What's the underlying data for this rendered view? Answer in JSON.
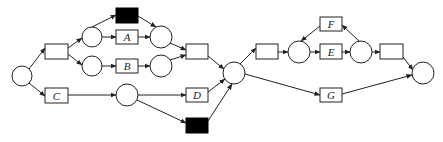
{
  "diagram": {
    "type": "petri-net",
    "places": [
      {
        "id": "p_start",
        "cx": 22,
        "cy": 76,
        "r": 10
      },
      {
        "id": "p1",
        "cx": 92,
        "cy": 37,
        "r": 10
      },
      {
        "id": "p2",
        "cx": 92,
        "cy": 66,
        "r": 10
      },
      {
        "id": "p3",
        "cx": 161,
        "cy": 37,
        "r": 11
      },
      {
        "id": "p4",
        "cx": 161,
        "cy": 66,
        "r": 11
      },
      {
        "id": "p5",
        "cx": 127,
        "cy": 95,
        "r": 11
      },
      {
        "id": "p_join",
        "cx": 234,
        "cy": 73,
        "r": 11
      },
      {
        "id": "p6",
        "cx": 299,
        "cy": 52,
        "r": 11
      },
      {
        "id": "p7",
        "cx": 361,
        "cy": 52,
        "r": 11
      },
      {
        "id": "p_end",
        "cx": 423,
        "cy": 73,
        "r": 11
      }
    ],
    "transitions": [
      {
        "id": "t_split",
        "label": "",
        "x": 45,
        "y": 44,
        "w": 23,
        "h": 15,
        "black": false
      },
      {
        "id": "t_C",
        "label": "C",
        "x": 45,
        "y": 88,
        "w": 23,
        "h": 15,
        "black": false
      },
      {
        "id": "t_skip1",
        "label": "",
        "x": 116,
        "y": 8,
        "w": 22,
        "h": 15,
        "black": true
      },
      {
        "id": "t_A",
        "label": "A",
        "x": 116,
        "y": 30,
        "w": 22,
        "h": 14,
        "black": false
      },
      {
        "id": "t_B",
        "label": "B",
        "x": 116,
        "y": 59,
        "w": 22,
        "h": 14,
        "black": false
      },
      {
        "id": "t_join1",
        "label": "",
        "x": 186,
        "y": 44,
        "w": 22,
        "h": 15,
        "black": false
      },
      {
        "id": "t_D",
        "label": "D",
        "x": 186,
        "y": 88,
        "w": 22,
        "h": 14,
        "black": false
      },
      {
        "id": "t_skip2",
        "label": "",
        "x": 186,
        "y": 118,
        "w": 22,
        "h": 15,
        "black": true
      },
      {
        "id": "t_split2",
        "label": "",
        "x": 256,
        "y": 44,
        "w": 22,
        "h": 15,
        "black": false
      },
      {
        "id": "t_F",
        "label": "F",
        "x": 320,
        "y": 17,
        "w": 22,
        "h": 14,
        "black": false
      },
      {
        "id": "t_E",
        "label": "E",
        "x": 320,
        "y": 44,
        "w": 22,
        "h": 15,
        "black": false
      },
      {
        "id": "t_G",
        "label": "G",
        "x": 320,
        "y": 88,
        "w": 22,
        "h": 14,
        "black": false
      },
      {
        "id": "t_join2",
        "label": "",
        "x": 380,
        "y": 44,
        "w": 23,
        "h": 15,
        "black": false
      }
    ],
    "arcs": [
      {
        "from": "p_start",
        "to": "t_split",
        "x1": 29,
        "y1": 69,
        "x2": 45,
        "y2": 48
      },
      {
        "from": "p_start",
        "to": "t_C",
        "x1": 29,
        "y1": 83,
        "x2": 45,
        "y2": 96
      },
      {
        "from": "t_split",
        "to": "p1",
        "x1": 68,
        "y1": 48,
        "x2": 82,
        "y2": 38
      },
      {
        "from": "t_split",
        "to": "p2",
        "x1": 68,
        "y1": 54,
        "x2": 82,
        "y2": 65
      },
      {
        "from": "p1",
        "to": "t_skip1",
        "x1": 92,
        "y1": 27,
        "x2": 116,
        "y2": 15
      },
      {
        "from": "p1",
        "to": "t_A",
        "x1": 102,
        "y1": 37,
        "x2": 116,
        "y2": 37
      },
      {
        "from": "p2",
        "to": "t_B",
        "x1": 102,
        "y1": 66,
        "x2": 116,
        "y2": 66
      },
      {
        "from": "t_skip1",
        "to": "p3",
        "x1": 138,
        "y1": 16,
        "x2": 156,
        "y2": 27
      },
      {
        "from": "t_A",
        "to": "p3",
        "x1": 138,
        "y1": 37,
        "x2": 150,
        "y2": 37
      },
      {
        "from": "t_B",
        "to": "p4",
        "x1": 138,
        "y1": 66,
        "x2": 150,
        "y2": 66
      },
      {
        "from": "p3",
        "to": "t_join1",
        "x1": 170,
        "y1": 43,
        "x2": 186,
        "y2": 50
      },
      {
        "from": "p4",
        "to": "t_join1",
        "x1": 170,
        "y1": 60,
        "x2": 186,
        "y2": 55
      },
      {
        "from": "t_C",
        "to": "p5",
        "x1": 68,
        "y1": 95,
        "x2": 116,
        "y2": 95
      },
      {
        "from": "p5",
        "to": "t_D",
        "x1": 138,
        "y1": 95,
        "x2": 186,
        "y2": 95
      },
      {
        "from": "p5",
        "to": "t_skip2",
        "x1": 137,
        "y1": 100,
        "x2": 186,
        "y2": 123
      },
      {
        "from": "t_join1",
        "to": "p_join",
        "x1": 208,
        "y1": 56,
        "x2": 224,
        "y2": 69
      },
      {
        "from": "t_D",
        "to": "p_join",
        "x1": 208,
        "y1": 92,
        "x2": 225,
        "y2": 79
      },
      {
        "from": "t_skip2",
        "to": "p_join",
        "x1": 208,
        "y1": 121,
        "x2": 232,
        "y2": 84
      },
      {
        "from": "p_join",
        "to": "t_split2",
        "x1": 240,
        "y1": 64,
        "x2": 256,
        "y2": 48
      },
      {
        "from": "p_join",
        "to": "t_G",
        "x1": 245,
        "y1": 74,
        "x2": 320,
        "y2": 95
      },
      {
        "from": "t_split2",
        "to": "p6",
        "x1": 278,
        "y1": 52,
        "x2": 288,
        "y2": 52
      },
      {
        "from": "p6",
        "to": "t_E",
        "x1": 310,
        "y1": 52,
        "x2": 320,
        "y2": 52
      },
      {
        "from": "t_F",
        "to": "p6",
        "x1": 320,
        "y1": 26,
        "x2": 301,
        "y2": 41
      },
      {
        "from": "t_E",
        "to": "p7",
        "x1": 342,
        "y1": 52,
        "x2": 350,
        "y2": 52
      },
      {
        "from": "p7",
        "to": "t_F",
        "x1": 359,
        "y1": 41,
        "x2": 342,
        "y2": 25
      },
      {
        "from": "p7",
        "to": "t_join2",
        "x1": 372,
        "y1": 52,
        "x2": 380,
        "y2": 52
      },
      {
        "from": "t_join2",
        "to": "p_end",
        "x1": 403,
        "y1": 57,
        "x2": 413,
        "y2": 70
      },
      {
        "from": "t_G",
        "to": "p_end",
        "x1": 342,
        "y1": 94,
        "x2": 412,
        "y2": 75
      }
    ]
  },
  "colors": {
    "stroke": "#222222",
    "silent_transition_fill": "#000000",
    "background": "#ffffff"
  }
}
